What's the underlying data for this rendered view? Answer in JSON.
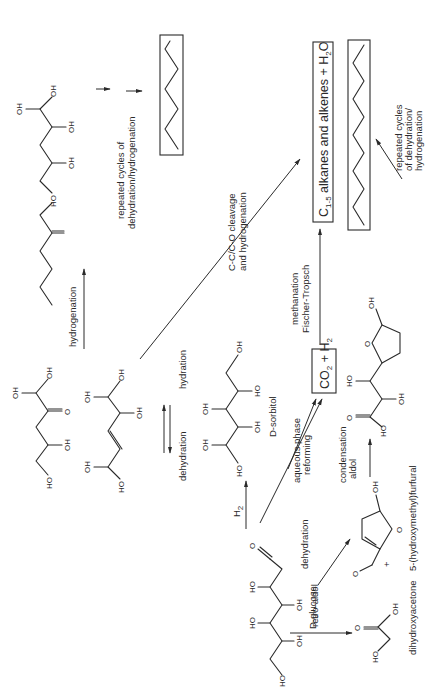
{
  "figure": {
    "type": "reaction-scheme",
    "orientation": "rotated-90-ccw",
    "compounds": {
      "glucose": "D-glucose",
      "sorbitol": "D-sorbitol",
      "hmf": "5-(hydroxymethyl)furfural",
      "dha": "dihydroxyacetone",
      "syngas": {
        "co2": "CO",
        "co2_sub": "2",
        "plus": "+",
        "h2": "H",
        "h2_sub": "2"
      },
      "light_alkanes": {
        "c": "C",
        "c_sub": "1-5",
        "text": " alkanes and alkenes + H",
        "h2o_sub": "2",
        "o": "O"
      }
    },
    "atoms": {
      "oh": "OH",
      "ho": "HO",
      "o": "O"
    },
    "reactions": {
      "hydrogenation": "hydrogenation",
      "h2": "H",
      "h2_sub": "2",
      "apr_1": "aqueous phase",
      "apr_2": "reforming",
      "dehydration": "dehydration",
      "hydration": "hydration",
      "cleavage_1": "C-C/C-O cleavage",
      "cleavage_2": "and hydrogenation",
      "methanation_1": "methanation",
      "methanation_2": "Fischer-Tropsch",
      "repeated_top_1": "repeated cycles of",
      "repeated_top_2": "dehydration/hydrogenation",
      "repeated_right_1": "repeated cycles",
      "repeated_right_2": "of dehydration/",
      "repeated_right_3": "hydrogenation",
      "retro_aldol_1": "retro-aldol",
      "retro_aldol_2": "condensation",
      "dehydration_hmf": "dehydration",
      "aldol_1": "aldol",
      "aldol_2": "condensation",
      "plus": "+"
    }
  }
}
